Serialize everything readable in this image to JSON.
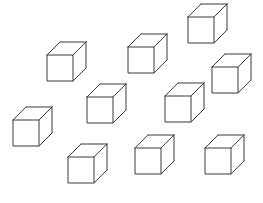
{
  "scene": {
    "title": "Cube Array",
    "description": "Ten identical wireframe cubes scattered on a white background",
    "background_color": "#ffffff",
    "width": 263,
    "height": 203,
    "cube_count": 10
  },
  "style": {
    "stroke_color": "#3a3a3a",
    "stroke_width": 1,
    "face_fill": "#ffffff",
    "face_size": 26,
    "depth_dx": 13,
    "depth_dy": -13,
    "projection": "oblique-cabinet-up-right"
  },
  "chart_data": {
    "type": "scatter",
    "xlabel": "",
    "ylabel": "",
    "xlim": [
      0,
      263
    ],
    "ylim": [
      0,
      203
    ],
    "grid": false,
    "legend": false,
    "marker": "wireframe-cube",
    "series": [
      {
        "name": "cubes",
        "points": [
          {
            "id": "cube-1",
            "x": 47,
            "y": 55,
            "label": "upper-left"
          },
          {
            "id": "cube-2",
            "x": 128,
            "y": 47,
            "label": "upper-middle"
          },
          {
            "id": "cube-3",
            "x": 188,
            "y": 17,
            "label": "top-right"
          },
          {
            "id": "cube-4",
            "x": 212,
            "y": 67,
            "label": "right-upper"
          },
          {
            "id": "cube-5",
            "x": 87,
            "y": 97,
            "label": "center-left"
          },
          {
            "id": "cube-6",
            "x": 165,
            "y": 96,
            "label": "center-right"
          },
          {
            "id": "cube-7",
            "x": 13,
            "y": 120,
            "label": "far-left"
          },
          {
            "id": "cube-8",
            "x": 68,
            "y": 157,
            "label": "bottom-left"
          },
          {
            "id": "cube-9",
            "x": 135,
            "y": 148,
            "label": "bottom-middle"
          },
          {
            "id": "cube-10",
            "x": 205,
            "y": 148,
            "label": "bottom-right"
          }
        ]
      }
    ]
  }
}
